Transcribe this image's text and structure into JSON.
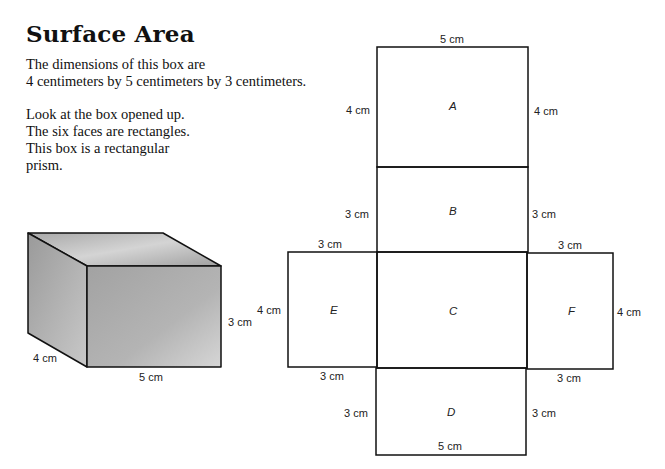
{
  "title": "Surface Area",
  "paragraphs": [
    "The dimensions of this box are\n4 centimeters by 5 centimeters by 3 centimeters.",
    "Look at the box opened up.\nThe six faces are rectangles.\nThis box is a rectangular\nprism."
  ],
  "box": {
    "depth_label": "4 cm",
    "width_label": "5 cm",
    "height_label": "3 cm"
  },
  "net": {
    "faces": [
      {
        "id": "A",
        "label": "A"
      },
      {
        "id": "B",
        "label": "B"
      },
      {
        "id": "C",
        "label": "C"
      },
      {
        "id": "D",
        "label": "D"
      },
      {
        "id": "E",
        "label": "E"
      },
      {
        "id": "F",
        "label": "F"
      }
    ],
    "labels": {
      "a_top": "5 cm",
      "a_left": "4 cm",
      "a_right": "4 cm",
      "b_left": "3 cm",
      "b_right": "3 cm",
      "e_top": "3 cm",
      "f_top": "3 cm",
      "e_left": "4 cm",
      "f_right": "4 cm",
      "e_bottom": "3 cm",
      "f_bottom": "3 cm",
      "d_left": "3 cm",
      "d_right": "3 cm",
      "d_bottom": "5 cm"
    }
  }
}
